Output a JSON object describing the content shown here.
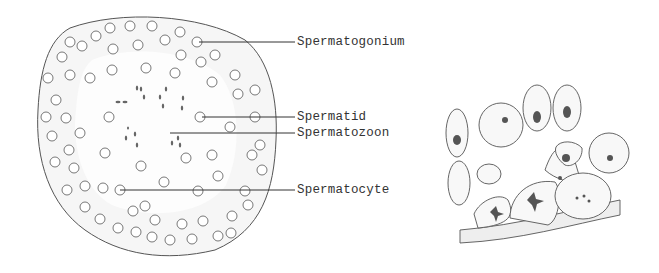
{
  "figure": {
    "left_panel": {
      "description": "Cross-section of seminiferous tubule",
      "labels": [
        {
          "id": "spermatogonium",
          "text": "Spermatogonium",
          "x": 297,
          "y": 35
        },
        {
          "id": "spermatid",
          "text": "Spermatid",
          "x": 297,
          "y": 110
        },
        {
          "id": "spermatozoon",
          "text": "Spermatozoon",
          "x": 297,
          "y": 126
        },
        {
          "id": "spermatocyte",
          "text": "Spermatocyte",
          "x": 297,
          "y": 183
        }
      ]
    },
    "right_panel": {
      "description": "Magnified detail of germ cells on basement membrane"
    },
    "colors": {
      "ink": "#444444",
      "stipple": "#e6e6e6",
      "nucleus": "#555555"
    }
  }
}
